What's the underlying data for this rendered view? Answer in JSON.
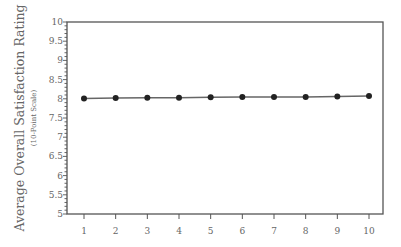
{
  "chart_data": {
    "type": "line",
    "title": "",
    "xlabel": "",
    "ylabel": "Average Overall Satisfaction Rating",
    "ylabel_sub": "(10-Point Scale)",
    "x": [
      1,
      2,
      3,
      4,
      5,
      6,
      7,
      8,
      9,
      10
    ],
    "x_tick_labels": [
      "1",
      "2",
      "3",
      "4",
      "5",
      "6",
      "7",
      "8",
      "9",
      "10"
    ],
    "y_tick_labels": [
      "5",
      "5.5",
      "6",
      "6.5",
      "7",
      "7.5",
      "8",
      "8.5",
      "9",
      "9.5",
      "10"
    ],
    "y_ticks": [
      5,
      5.5,
      6,
      6.5,
      7,
      7.5,
      8,
      8.5,
      9,
      9.5,
      10
    ],
    "ylim": [
      5,
      10
    ],
    "xlim": [
      0.5,
      10.6
    ],
    "grid": false,
    "legend": null,
    "series": [
      {
        "name": "Average Overall Satisfaction",
        "values": [
          8.01,
          8.02,
          8.03,
          8.03,
          8.04,
          8.05,
          8.05,
          8.05,
          8.06,
          8.07
        ],
        "marker": "circle",
        "color": "#222222"
      }
    ],
    "colors": {
      "axis": "#555555",
      "text": "#666666",
      "line": "#666666",
      "marker": "#222222"
    }
  }
}
